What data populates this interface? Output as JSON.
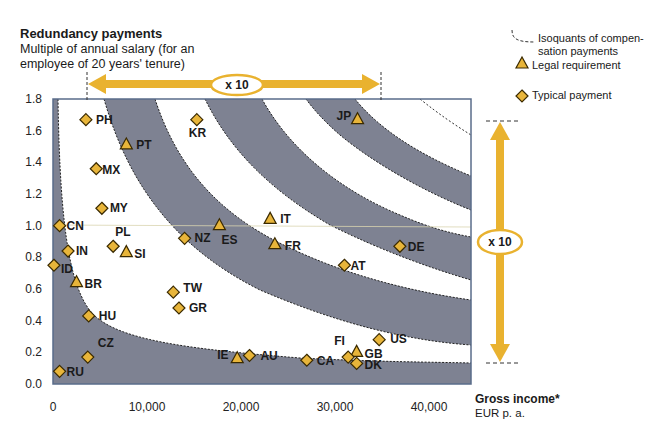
{
  "chart_data": {
    "type": "scatter",
    "title": "Redundancy payments",
    "subtitle": "Multiple of annual salary (for an employee of 20 years' tenure)",
    "xlabel": "Gross income*",
    "xlabel_unit": "EUR p. a.",
    "ylabel": "Multiple of annual salary",
    "xlim": [
      0,
      44000
    ],
    "ylim": [
      0,
      1.8
    ],
    "x_ticks": [
      "0",
      "10,000",
      "20,000",
      "30,000",
      "40,000"
    ],
    "y_ticks": [
      "0.0",
      "0.2",
      "0.4",
      "0.6",
      "0.8",
      "1.0",
      "1.2",
      "1.4",
      "1.6",
      "1.8"
    ],
    "grid": false,
    "legend": [
      {
        "name": "Isoquants of compensation payments",
        "symbol": "dashed-curve"
      },
      {
        "name": "Legal requirement",
        "symbol": "triangle"
      },
      {
        "name": "Typical payment",
        "symbol": "diamond"
      }
    ],
    "legend_position": "top-right",
    "annotations": [
      {
        "text": "x 10",
        "type": "horizontal double arrow",
        "from_x": 3500,
        "to_x": 35000
      },
      {
        "text": "x 10",
        "type": "vertical double arrow",
        "from_y": 0.13,
        "to_y": 1.66
      }
    ],
    "series": [
      {
        "name": "Legal requirement",
        "marker": "triangle",
        "points": [
          {
            "label": "PT",
            "x": 7800,
            "y": 1.51
          },
          {
            "label": "SI",
            "x": 7800,
            "y": 0.83
          },
          {
            "label": "BR",
            "x": 2500,
            "y": 0.64
          },
          {
            "label": "ES",
            "x": 17700,
            "y": 1.0
          },
          {
            "label": "IT",
            "x": 23100,
            "y": 1.04
          },
          {
            "label": "FR",
            "x": 23600,
            "y": 0.88
          },
          {
            "label": "JP",
            "x": 32400,
            "y": 1.67
          },
          {
            "label": "IE",
            "x": 19600,
            "y": 0.16
          },
          {
            "label": "GB",
            "x": 32300,
            "y": 0.2
          }
        ]
      },
      {
        "name": "Typical payment",
        "marker": "diamond",
        "points": [
          {
            "label": "PH",
            "x": 3500,
            "y": 1.67
          },
          {
            "label": "MX",
            "x": 4600,
            "y": 1.36
          },
          {
            "label": "MY",
            "x": 5200,
            "y": 1.11
          },
          {
            "label": "CN",
            "x": 700,
            "y": 1.0
          },
          {
            "label": "IN",
            "x": 1600,
            "y": 0.84
          },
          {
            "label": "PL",
            "x": 6400,
            "y": 0.87
          },
          {
            "label": "ID",
            "x": 100,
            "y": 0.75
          },
          {
            "label": "HU",
            "x": 3800,
            "y": 0.43
          },
          {
            "label": "CZ",
            "x": 3700,
            "y": 0.17
          },
          {
            "label": "RU",
            "x": 700,
            "y": 0.08
          },
          {
            "label": "KR",
            "x": 15300,
            "y": 1.67
          },
          {
            "label": "NZ",
            "x": 14000,
            "y": 0.92
          },
          {
            "label": "TW",
            "x": 12800,
            "y": 0.58
          },
          {
            "label": "GR",
            "x": 13400,
            "y": 0.48
          },
          {
            "label": "DE",
            "x": 36900,
            "y": 0.87
          },
          {
            "label": "AT",
            "x": 31000,
            "y": 0.75
          },
          {
            "label": "AU",
            "x": 20900,
            "y": 0.18
          },
          {
            "label": "CA",
            "x": 27000,
            "y": 0.15
          },
          {
            "label": "FI",
            "x": 31400,
            "y": 0.17
          },
          {
            "label": "DK",
            "x": 32300,
            "y": 0.13
          },
          {
            "label": "US",
            "x": 34700,
            "y": 0.28
          }
        ]
      }
    ]
  },
  "header": {
    "title": "Redundancy payments",
    "subtitle_line1": "Multiple of annual salary (for an",
    "subtitle_line2": "employee of 20 years' tenure)"
  },
  "legend": {
    "isoquant_line1": "Isoquants of compen-",
    "isoquant_line2": "sation payments",
    "legal": "Legal requirement",
    "typical": "Typical payment"
  },
  "axis": {
    "x_title": "Gross income*",
    "x_unit": "EUR p. a."
  },
  "annotations": {
    "horizontal_factor": "x 10",
    "vertical_factor": "x 10"
  },
  "colors": {
    "band": "#7e8292",
    "marker_fill": "#e8b53a",
    "marker_stroke": "#3a2a00",
    "arrow": "#e9b22f",
    "axis": "#5a6c8a"
  }
}
